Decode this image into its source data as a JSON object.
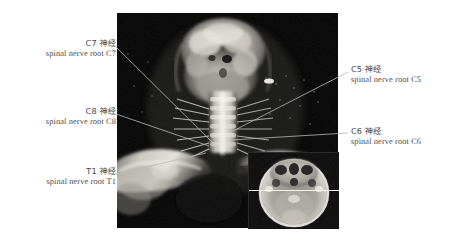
{
  "figure": {
    "background_color": "#ffffff",
    "ink_color": "#4a4a4a",
    "plate": {
      "name": "coronal neck MRI plate",
      "background_color": "#050505"
    },
    "inset": {
      "name": "axial head MRI inset",
      "reference_line_color": "#f2f2ee"
    }
  },
  "annotations": [
    {
      "id": "c7",
      "cjk": "C7 神经",
      "latin": "spinal nerve root C7",
      "align": "right"
    },
    {
      "id": "c8",
      "cjk": "C8 神经",
      "latin": "spinal nerve root C8",
      "align": "right"
    },
    {
      "id": "t1",
      "cjk": "T1 神经",
      "latin": "spinal nerve root T1",
      "align": "right"
    },
    {
      "id": "c5",
      "cjk": "C5 神经",
      "latin": "spinal nerve root C5",
      "align": "left"
    },
    {
      "id": "c6",
      "cjk": "C6 神经",
      "latin": "spinal nerve root C6",
      "align": "left"
    }
  ],
  "leader_lines": {
    "color": "#b9b9b4",
    "paths": [
      {
        "id": "c7",
        "x1": 116,
        "y1": 47,
        "x2": 213,
        "y2": 143
      },
      {
        "id": "c8",
        "x1": 116,
        "y1": 114,
        "x2": 209,
        "y2": 146
      },
      {
        "id": "t1",
        "x1": 116,
        "y1": 174,
        "x2": 206,
        "y2": 153
      },
      {
        "id": "c5",
        "x1": 348,
        "y1": 72,
        "x2": 233,
        "y2": 131
      },
      {
        "id": "c6",
        "x1": 348,
        "y1": 133,
        "x2": 230,
        "y2": 140
      }
    ]
  }
}
